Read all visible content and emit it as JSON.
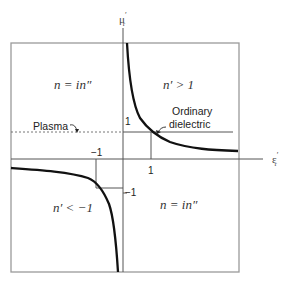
{
  "diagram": {
    "axes": {
      "y_label": "μ′r",
      "y_label_main": "μ",
      "y_label_sup": "′",
      "y_label_sub": "r",
      "x_label_main": "ε",
      "x_label_sup": "′",
      "x_label_sub": "r"
    },
    "ticks": {
      "y_pos": "1",
      "y_neg": "−1",
      "x_pos": "1",
      "x_neg": "−1"
    },
    "regions": {
      "top_left": "n = in″",
      "top_right": "n′ > 1",
      "bottom_left": "n′ < −1",
      "bottom_right": "n = in″"
    },
    "annotations": {
      "plasma": "Plasma",
      "ordinary_line1": "Ordinary",
      "ordinary_line2": "dielectric"
    },
    "colors": {
      "frame": "#9a9a9a",
      "axis": "#555555",
      "curve": "#111111",
      "dashed": "#666666"
    }
  }
}
